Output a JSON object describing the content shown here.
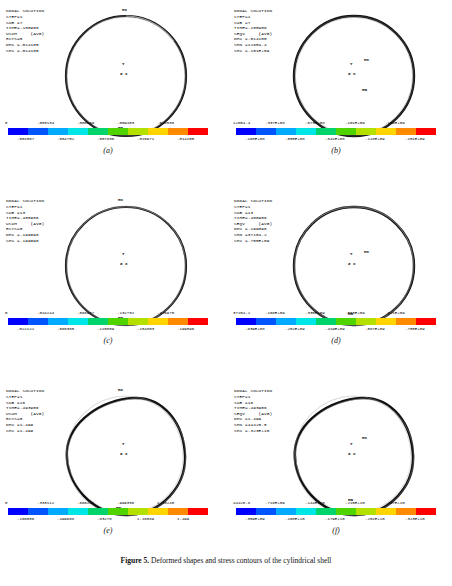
{
  "figure": {
    "caption_prefix": "Figure",
    "caption_number": "5",
    "caption_text": "Deformed shapes and stress contours of the cylindrical shell"
  },
  "colorbar": {
    "colors": [
      "#0000ff",
      "#0055ff",
      "#00aaff",
      "#00e5e5",
      "#00d46a",
      "#4fd400",
      "#b4e000",
      "#ffd400",
      "#ff8a00",
      "#ff0000"
    ]
  },
  "panels": [
    {
      "id": "a",
      "caption": "(a)",
      "header": "NODAL SOLUTION\nSTEP=1\nSUB =7\nTIME=.108906\nUSUM     (AVG)\nRSYS=0\nDMX =.014105\nSMX =.014105",
      "axis_label": "Z  X",
      "axis_y": "Y",
      "marks": [
        {
          "text": "MX",
          "x": 122,
          "y": 10
        },
        {
          "text": "MN",
          "x": 118,
          "y": 128
        }
      ],
      "colorbar_top": [
        "0",
        ".003134",
        ".006269",
        ".009403",
        ".012538"
      ],
      "colorbar_bottom": [
        ".001567",
        ".004702",
        ".007836",
        ".010971",
        ".014105"
      ]
    },
    {
      "id": "b",
      "caption": "(b)",
      "header": "NODAL SOLUTION\nSTEP=1\nSUB =7\nTIME=.108906\nSEQV     (AVG)\nDMX =.014105\nSMN =12654.4\nSMX =.151E+09",
      "axis_label": "Z  X",
      "axis_y": "Y",
      "marks": [
        {
          "text": "MX",
          "x": 136,
          "y": 60
        },
        {
          "text": "MN",
          "x": 133,
          "y": 88
        }
      ],
      "colorbar_top": [
        "12654.4",
        ".337E+08",
        ".673E+08",
        ".101E+09",
        ".134E+09"
      ],
      "colorbar_bottom": [
        ".168E+08",
        ".505E+08",
        ".841E+08",
        ".118E+09",
        ".151E+09"
      ]
    },
    {
      "id": "c",
      "caption": "(c)",
      "header": "NODAL SOLUTION\nSTEP=1\nSUB =13\nTIME=.408906\nUSUM     (AVG)\nRSYS=0\nDMX =.199096\nSMX =.199096",
      "axis_label": "Z  X",
      "axis_y": "Y",
      "marks": [
        {
          "text": "MX",
          "x": 70,
          "y": 8
        },
        {
          "text": "MN",
          "x": 118,
          "y": 128
        }
      ],
      "colorbar_top": [
        "0",
        ".044244",
        ".088487",
        ".132731",
        ".176975"
      ],
      "colorbar_bottom": [
        ".022122",
        ".066365",
        ".110609",
        ".154853",
        ".199096"
      ]
    },
    {
      "id": "d",
      "caption": "(d)",
      "header": "NODAL SOLUTION\nSTEP=1\nSUB =13\nTIME=.408906\nSEQV     (AVG)\nDMX =.199096\nSMN =37154.2\nSMX =.755E+09",
      "axis_label": "Z  X",
      "axis_y": "Y",
      "marks": [
        {
          "text": "MX",
          "x": 136,
          "y": 62
        },
        {
          "text": "MN",
          "x": 120,
          "y": 124
        }
      ],
      "colorbar_top": [
        "37154.2",
        ".168E+09",
        ".335E+09",
        ".503E+09",
        ".671E+09"
      ],
      "colorbar_bottom": [
        ".839E+08",
        ".252E+09",
        ".419E+09",
        ".587E+09",
        ".755E+09"
      ]
    },
    {
      "id": "e",
      "caption": "(e)",
      "header": "NODAL SOLUTION\nSTEP=1\nSUB =16\nTIME=.493906\nUSUM     (AVG)\nRSYS=0\nDMX =1.499\nSMX =1.499",
      "axis_label": "Z  X",
      "axis_y": "Y",
      "marks": [
        {
          "text": "MX",
          "x": 70,
          "y": 8
        },
        {
          "text": "MN",
          "x": 116,
          "y": 128
        }
      ],
      "colorbar_top": [
        "0",
        ".333112",
        ".666224",
        ".999336",
        "1.33245"
      ],
      "colorbar_bottom": [
        ".166556",
        ".499668",
        ".83278",
        "1.16589",
        "1.499"
      ]
    },
    {
      "id": "f",
      "caption": "(f)",
      "header": "NODAL SOLUTION\nSTEP=1\nSUB =16\nTIME=.493906\nSEQV     (AVG)\nDMX =1.499\nSMN =44425.8\nSMX =.323E+10",
      "axis_label": "Z  X",
      "axis_y": "Y",
      "marks": [
        {
          "text": "MX",
          "x": 134,
          "y": 58
        },
        {
          "text": "MN",
          "x": 120,
          "y": 120
        }
      ],
      "colorbar_top": [
        "44425.8",
        ".718E+09",
        ".144E+10",
        ".215E+10",
        ".287E+10"
      ],
      "colorbar_bottom": [
        ".359E+09",
        ".108E+10",
        ".179E+10",
        ".251E+10",
        ".323E+10"
      ]
    }
  ]
}
